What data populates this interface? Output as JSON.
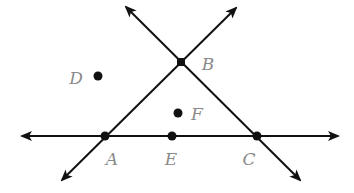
{
  "diagram": {
    "type": "geometry",
    "stroke_color": "#111111",
    "label_color": "#8a8a8a",
    "points": [
      {
        "name": "A",
        "x": 105,
        "y": 136,
        "label_x": 112,
        "label_y": 159
      },
      {
        "name": "B",
        "x": 181,
        "y": 62,
        "label_x": 208,
        "label_y": 64
      },
      {
        "name": "C",
        "x": 257,
        "y": 136,
        "label_x": 249,
        "label_y": 159
      },
      {
        "name": "D",
        "x": 98,
        "y": 76,
        "label_x": 76,
        "label_y": 78
      },
      {
        "name": "E",
        "x": 172,
        "y": 136,
        "label_x": 171,
        "label_y": 159
      },
      {
        "name": "F",
        "x": 178,
        "y": 113,
        "label_x": 197,
        "label_y": 114
      }
    ],
    "lines": [
      {
        "name": "line-AC",
        "through": [
          "A",
          "E",
          "C"
        ],
        "x1": 22,
        "y1": 136,
        "x2": 338,
        "y2": 136
      },
      {
        "name": "line-AB",
        "through": [
          "A",
          "B"
        ],
        "x1": 62,
        "y1": 180,
        "x2": 236,
        "y2": 8
      },
      {
        "name": "line-BC",
        "through": [
          "B",
          "C"
        ],
        "x1": 126,
        "y1": 7,
        "x2": 300,
        "y2": 180
      }
    ],
    "labels": {
      "A": "A",
      "B": "B",
      "C": "C",
      "D": "D",
      "E": "E",
      "F": "F"
    }
  }
}
